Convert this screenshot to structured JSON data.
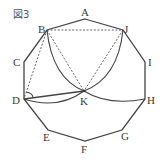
{
  "figure": {
    "title": "図3",
    "labels": {
      "A": "A",
      "B": "B",
      "C": "C",
      "D": "D",
      "E": "E",
      "F": "F",
      "G": "G",
      "H": "H",
      "I": "I",
      "J": "J",
      "K": "K"
    },
    "polygon": "decagon ABCDEFGHIJ",
    "solid_segments": [
      "DK"
    ],
    "dashed_segments": [
      "BJ",
      "BK",
      "JK",
      "BD"
    ],
    "arcs": [
      "B-K",
      "J-K",
      "D-K",
      "K-H"
    ],
    "angle_mark": "D"
  }
}
